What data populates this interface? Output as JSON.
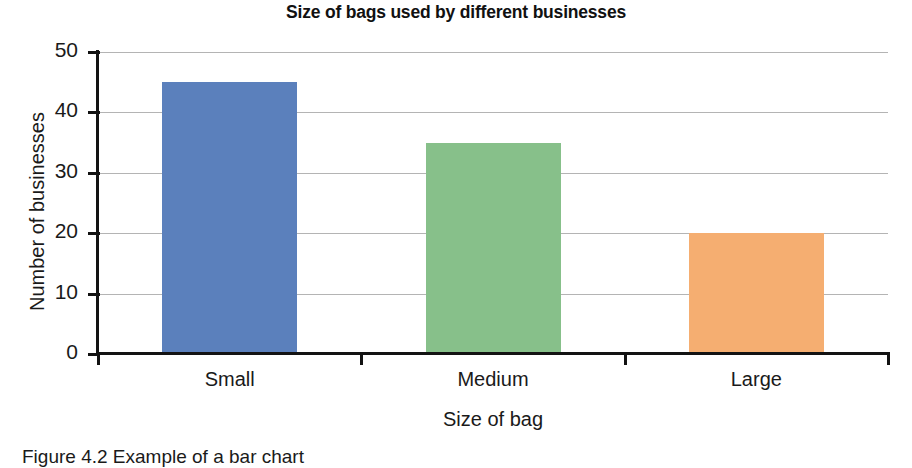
{
  "chart_data": {
    "type": "bar",
    "title": "Size of bags used by different businesses",
    "xlabel": "Size of bag",
    "ylabel": "Number of businesses",
    "categories": [
      "Small",
      "Medium",
      "Large"
    ],
    "values": [
      45,
      35,
      20
    ],
    "bar_colors": [
      "#5b80bc",
      "#87c08a",
      "#f5ae71"
    ],
    "ylim": [
      0,
      50
    ],
    "yticks": [
      0,
      10,
      20,
      30,
      40,
      50
    ],
    "ytick_labels": [
      "0",
      "10",
      "20",
      "30",
      "40",
      "50"
    ],
    "grid": "horizontal",
    "legend": "none",
    "axis_color": "#131313",
    "grid_color": "#b4b4b4"
  },
  "caption": {
    "text": "Figure 4.2 Example of a bar chart"
  }
}
